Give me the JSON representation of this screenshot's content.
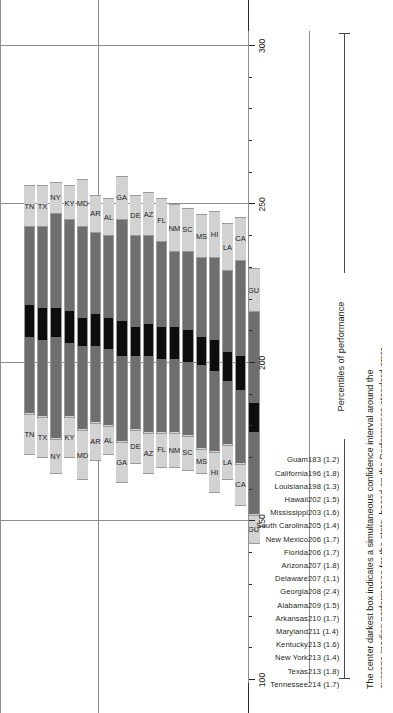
{
  "chart_data": {
    "type": "bar",
    "title": "",
    "xlabel": "Percentiles of performance",
    "ylabel": "",
    "xlim": [
      100,
      305
    ],
    "grid": true,
    "legend_position": "none",
    "axis": {
      "major_ticks": [
        100,
        150,
        200,
        250,
        300
      ],
      "minor_tick_step": 10,
      "tick_labels": [
        "100",
        "150",
        "200",
        "250",
        "300"
      ]
    },
    "gridlines": [
      150,
      200,
      250,
      300
    ],
    "series_note": "Each bar is a 5-segment percentile band: 10th-25th (light), 25th-CI low (dark), CI low-CI high (black center), CI high-75th (dark), 75th-90th (light).",
    "segments": [
      "p10_p25",
      "p25_ci_low",
      "ci_low_ci_high",
      "ci_high_p75",
      "p75_p90"
    ],
    "colors": {
      "outer_band": "#d2d2d2",
      "inner_band": "#6e6e6e",
      "center_box": "#0d0d0d",
      "bar_border": "#9a9a9a",
      "gridline": "#8d8d8d",
      "axis": "#2a2a2a",
      "text": "#231f20"
    },
    "categories": [
      "Tennessee",
      "Texas",
      "New York",
      "Kentucky",
      "Maryland",
      "Arkansas",
      "Alabama",
      "Georgia",
      "Delaware",
      "Arizona",
      "Florida",
      "New Mexico",
      "South Carolina",
      "Mississippi",
      "Hawaii",
      "Louisiana",
      "California",
      "Guam"
    ],
    "abbreviations": [
      "TN",
      "TX",
      "NY",
      "KY",
      "MD",
      "AR",
      "AL",
      "GA",
      "DE",
      "AZ",
      "FL",
      "NM",
      "SC",
      "MS",
      "HI",
      "LA",
      "CA",
      "GU"
    ],
    "means": [
      214,
      213,
      213,
      213,
      211,
      210,
      209,
      208,
      207,
      207,
      206,
      206,
      205,
      203,
      202,
      198,
      196,
      183
    ],
    "standard_errors": [
      1.7,
      1.8,
      1.4,
      1.6,
      1.4,
      1.7,
      1.5,
      2.4,
      1.1,
      1.8,
      1.7,
      1.7,
      1.4,
      1.6,
      1.5,
      1.3,
      1.8,
      1.2
    ],
    "rows": [
      {
        "name": "Tennessee",
        "abbr": "TN",
        "value": "214",
        "se": "(1.7)",
        "p10": 171,
        "p25": 184,
        "ci_low": 208,
        "ci_high": 218,
        "p75": 243,
        "p90": 256
      },
      {
        "name": "Texas",
        "abbr": "TX",
        "value": "213",
        "se": "(1.8)",
        "p10": 170,
        "p25": 183,
        "ci_low": 207,
        "ci_high": 217,
        "p75": 243,
        "p90": 256
      },
      {
        "name": "New York",
        "abbr": "NY",
        "value": "213",
        "se": "(1.4)",
        "p10": 165,
        "p25": 176,
        "ci_low": 208,
        "ci_high": 217,
        "p75": 247,
        "p90": 257
      },
      {
        "name": "Kentucky",
        "abbr": "KY",
        "value": "213",
        "se": "(1.6)",
        "p10": 170,
        "p25": 183,
        "ci_low": 206,
        "ci_high": 216,
        "p75": 245,
        "p90": 256
      },
      {
        "name": "Maryland",
        "abbr": "MD",
        "value": "211",
        "se": "(1.4)",
        "p10": 163,
        "p25": 179,
        "ci_low": 205,
        "ci_high": 214,
        "p75": 243,
        "p90": 258
      },
      {
        "name": "Arkansas",
        "abbr": "AR",
        "value": "210",
        "se": "(1.7)",
        "p10": 169,
        "p25": 181,
        "ci_low": 205,
        "ci_high": 215,
        "p75": 241,
        "p90": 253
      },
      {
        "name": "Alabama",
        "abbr": "AL",
        "value": "209",
        "se": "(1.5)",
        "p10": 171,
        "p25": 180,
        "ci_low": 204,
        "ci_high": 214,
        "p75": 240,
        "p90": 252
      },
      {
        "name": "Georgia",
        "abbr": "GA",
        "value": "208",
        "se": "(2.4)",
        "p10": 162,
        "p25": 175,
        "ci_low": 202,
        "ci_high": 213,
        "p75": 245,
        "p90": 259
      },
      {
        "name": "Delaware",
        "abbr": "DE",
        "value": "207",
        "se": "(1.1)",
        "p10": 168,
        "p25": 179,
        "ci_low": 202,
        "ci_high": 211,
        "p75": 240,
        "p90": 253
      },
      {
        "name": "Arizona",
        "abbr": "AZ",
        "value": "207",
        "se": "(1.8)",
        "p10": 165,
        "p25": 178,
        "ci_low": 202,
        "ci_high": 212,
        "p75": 240,
        "p90": 254
      },
      {
        "name": "Florida",
        "abbr": "FL",
        "value": "206",
        "se": "(1.7)",
        "p10": 167,
        "p25": 178,
        "ci_low": 201,
        "ci_high": 211,
        "p75": 238,
        "p90": 252
      },
      {
        "name": "New Mexico",
        "abbr": "NM",
        "value": "206",
        "se": "(1.7)",
        "p10": 167,
        "p25": 178,
        "ci_low": 201,
        "ci_high": 211,
        "p75": 235,
        "p90": 250
      },
      {
        "name": "South Carolina",
        "abbr": "SC",
        "value": "205",
        "se": "(1.4)",
        "p10": 166,
        "p25": 177,
        "ci_low": 200,
        "ci_high": 210,
        "p75": 235,
        "p90": 249
      },
      {
        "name": "Mississippi",
        "abbr": "MS",
        "value": "203",
        "se": "(1.6)",
        "p10": 165,
        "p25": 173,
        "ci_low": 199,
        "ci_high": 208,
        "p75": 233,
        "p90": 247
      },
      {
        "name": "Hawaii",
        "abbr": "HI",
        "value": "202",
        "se": "(1.5)",
        "p10": 159,
        "p25": 172,
        "ci_low": 197,
        "ci_high": 207,
        "p75": 233,
        "p90": 248
      },
      {
        "name": "Louisiana",
        "abbr": "LA",
        "value": "198",
        "se": "(1.3)",
        "p10": 163,
        "p25": 174,
        "ci_low": 194,
        "ci_high": 203,
        "p75": 229,
        "p90": 244
      },
      {
        "name": "California",
        "abbr": "CA",
        "value": "196",
        "se": "(1.8)",
        "p10": 155,
        "p25": 168,
        "ci_low": 191,
        "ci_high": 202,
        "p75": 232,
        "p90": 246
      },
      {
        "name": "Guam",
        "abbr": "GU",
        "value": "183",
        "se": "(1.2)",
        "p10": 143,
        "p25": 152,
        "ci_low": 178,
        "ci_high": 187,
        "p75": 216,
        "p90": 230
      }
    ]
  },
  "axis_title": "Percentiles of performance",
  "footnote": {
    "line1": "The center darkest box indicates a simultaneous confidence interval around the",
    "line2": "average median performance for the state, based on the Performance standard error."
  }
}
